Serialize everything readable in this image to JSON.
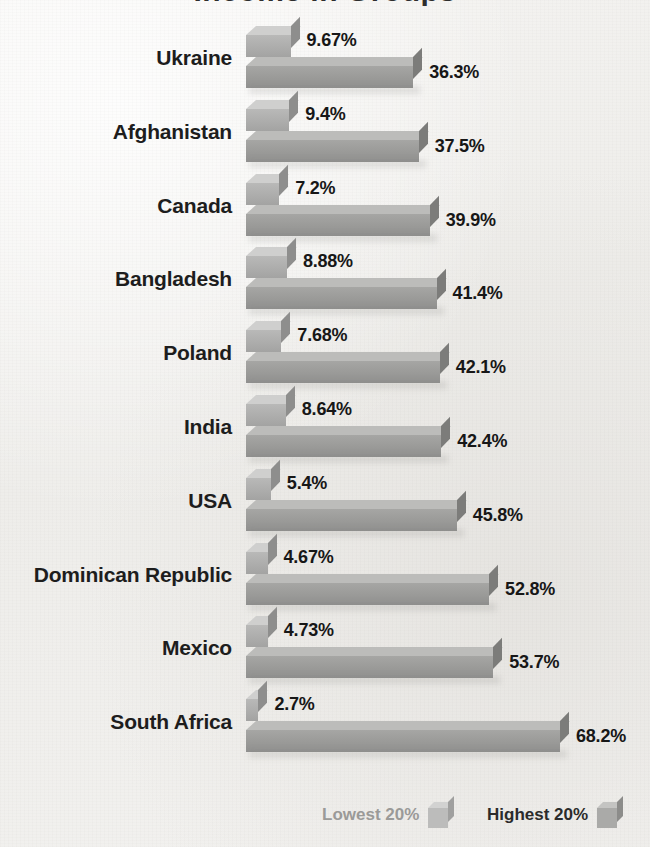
{
  "title": "Income in Groups",
  "chart_data": {
    "type": "bar",
    "title": "Income in Groups",
    "xlabel": "",
    "ylabel": "",
    "orientation": "horizontal",
    "grid": false,
    "legend_position": "bottom",
    "xlim": [
      0,
      68.2
    ],
    "categories": [
      "Ukraine",
      "Afghanistan",
      "Canada",
      "Bangladesh",
      "Poland",
      "India",
      "USA",
      "Dominican Republic",
      "Mexico",
      "South Africa"
    ],
    "series": [
      {
        "name": "Lowest 20%",
        "values": [
          9.67,
          9.4,
          7.2,
          8.88,
          7.68,
          8.64,
          5.4,
          4.67,
          4.73,
          2.7
        ],
        "labels": [
          "9.67%",
          "9.4%",
          "7.2%",
          "8.88%",
          "7.68%",
          "8.64%",
          "5.4%",
          "4.67%",
          "4.73%",
          "2.7%"
        ]
      },
      {
        "name": "Highest 20%",
        "values": [
          36.3,
          37.5,
          39.9,
          41.4,
          42.1,
          42.4,
          45.8,
          52.8,
          53.7,
          68.2
        ],
        "labels": [
          "36.3%",
          "37.5%",
          "39.9%",
          "41.4%",
          "42.1%",
          "42.4%",
          "45.8%",
          "52.8%",
          "53.7%",
          "68.2%"
        ]
      }
    ]
  },
  "legend": {
    "items": [
      {
        "label": "Lowest 20%",
        "swatch": "light-gray-cube",
        "color": "#bcbcbb"
      },
      {
        "label": "Highest 20%",
        "swatch": "dark-gray-cube",
        "color": "#aaaaa8"
      }
    ]
  },
  "colors": {
    "background": "#f2f1ef",
    "lowest_bar": "#adadac",
    "highest_bar": "#9a9a98",
    "label_text": "#1d1d1d",
    "value_text": "#171717"
  }
}
